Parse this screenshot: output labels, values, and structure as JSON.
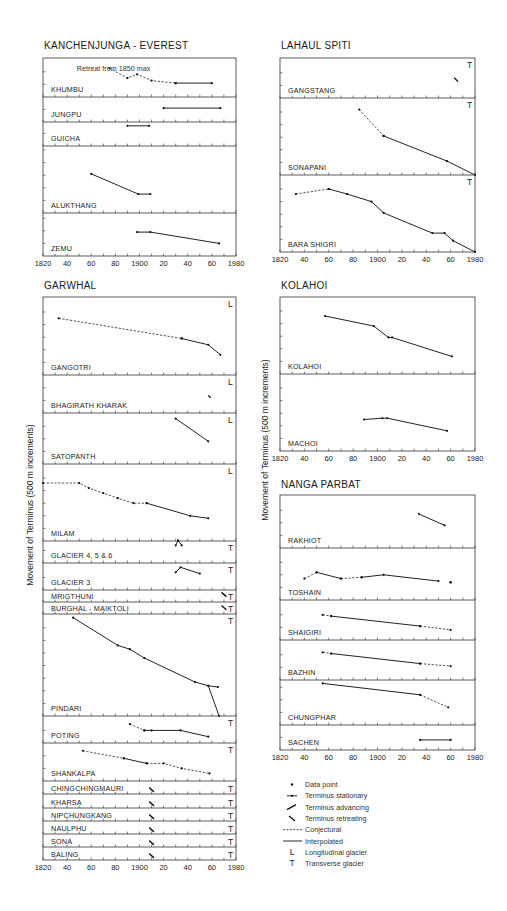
{
  "figure": {
    "y_axis_label": "Movement of Terminus (500 m increments)",
    "x_tick_labels": [
      "1820",
      "40",
      "60",
      "80",
      "1900",
      "20",
      "40",
      "60",
      "1980"
    ]
  },
  "legend": [
    {
      "symbol": "data-point",
      "label": "Data point"
    },
    {
      "symbol": "stationary",
      "label": "Terminus stationary"
    },
    {
      "symbol": "advancing",
      "label": "Terminus advancing"
    },
    {
      "symbol": "retreating",
      "label": "Terminus retreating"
    },
    {
      "symbol": "conjectural",
      "label": "Conjectural"
    },
    {
      "symbol": "interpolated",
      "label": "Interpolated"
    },
    {
      "symbol": "L",
      "label": "Longitudinal glacier"
    },
    {
      "symbol": "T",
      "label": "Transverse glacier"
    }
  ],
  "chart_data": [
    {
      "type": "line",
      "region": "KANCHENJUNGA - EVEREST",
      "xlim": [
        1820,
        1980
      ],
      "xlabel": "Year",
      "ylabel": "Movement of Terminus (500 m increments)",
      "annotation": "Retreat from 1850 max",
      "glaciers": [
        {
          "name": "KHUMBU",
          "type": "",
          "conjectural": [
            [
              1875,
              2.3
            ],
            [
              1890,
              1.5
            ],
            [
              1898,
              1.8
            ],
            [
              1910,
              1.3
            ],
            [
              1930,
              1.1
            ]
          ],
          "interpolated": [
            [
              1930,
              1.1
            ],
            [
              1960,
              1.1
            ]
          ]
        },
        {
          "name": "JUNGPU",
          "type": "",
          "interpolated": [
            [
              1920,
              1.1
            ],
            [
              1967,
              1.1
            ]
          ]
        },
        {
          "name": "GUICHA",
          "type": "",
          "interpolated": [
            [
              1890,
              1.6
            ],
            [
              1908,
              1.6
            ]
          ]
        },
        {
          "name": "ALUKTHANG",
          "type": "",
          "interpolated": [
            [
              1860,
              3.1
            ],
            [
              1899,
              1.5
            ],
            [
              1909,
              1.5
            ]
          ]
        },
        {
          "name": "ZEMU",
          "type": "",
          "interpolated": [
            [
              1898,
              1.9
            ],
            [
              1909,
              1.9
            ],
            [
              1966,
              1.0
            ]
          ]
        }
      ]
    },
    {
      "type": "line",
      "region": "LAHAUL SPITI",
      "xlim": [
        1820,
        1980
      ],
      "glaciers": [
        {
          "name": "GANGSTANG",
          "type": "T",
          "retreating": [
            [
              1963,
              1.6
            ],
            [
              1966,
              1.3
            ]
          ]
        },
        {
          "name": "SONAPANI",
          "type": "T",
          "conjectural": [
            [
              1885,
              5.2
            ],
            [
              1905,
              3.1
            ]
          ],
          "interpolated": [
            [
              1905,
              3.1
            ],
            [
              1957,
              1.1
            ],
            [
              1980,
              0.0
            ]
          ]
        },
        {
          "name": "BARA SHIGRI",
          "type": "T",
          "conjectural": [
            [
              1833,
              4.6
            ],
            [
              1860,
              5.0
            ]
          ],
          "interpolated": [
            [
              1860,
              5.0
            ],
            [
              1875,
              4.6
            ],
            [
              1895,
              4.0
            ],
            [
              1905,
              3.1
            ],
            [
              1945,
              1.5
            ],
            [
              1955,
              1.5
            ],
            [
              1962,
              0.9
            ],
            [
              1980,
              0.0
            ]
          ]
        }
      ]
    },
    {
      "type": "line",
      "region": "GARWHAL",
      "xlim": [
        1820,
        1980
      ],
      "glaciers": [
        {
          "name": "GANGOTRI",
          "type": "L",
          "conjectural": [
            [
              1833,
              4.5
            ],
            [
              1935,
              2.9
            ]
          ],
          "interpolated": [
            [
              1935,
              2.9
            ],
            [
              1957,
              2.4
            ],
            [
              1967,
              1.6
            ]
          ]
        },
        {
          "name": "BHAGIRATH KHARAK",
          "type": "L",
          "retreating": [
            [
              1957,
              1.4
            ],
            [
              1959,
              1.2
            ]
          ]
        },
        {
          "name": "SATOPANTH",
          "type": "L",
          "interpolated": [
            [
              1930,
              3.6
            ],
            [
              1957,
              1.8
            ]
          ]
        },
        {
          "name": "MILAM",
          "type": "L",
          "conjectural": [
            [
              1820,
              4.6
            ],
            [
              1850,
              4.6
            ],
            [
              1858,
              4.2
            ],
            [
              1870,
              3.8
            ],
            [
              1882,
              3.4
            ],
            [
              1895,
              3.0
            ],
            [
              1906,
              3.0
            ]
          ],
          "interpolated": [
            [
              1906,
              3.0
            ],
            [
              1942,
              2.0
            ],
            [
              1957,
              1.8
            ]
          ]
        },
        {
          "name": "GLACIER 4, 5 & 6",
          "type": "T",
          "advancing": [
            [
              1930,
              1.4
            ],
            [
              1932,
              1.8
            ],
            [
              1935,
              1.4
            ]
          ]
        },
        {
          "name": "GLACIER 3",
          "type": "T",
          "interpolated": [
            [
              1930,
              1.4
            ],
            [
              1934,
              1.8
            ],
            [
              1950,
              1.3
            ]
          ]
        },
        {
          "name": "MRIGTHUNI",
          "type": "T",
          "retreating": [
            [
              1968,
              0.9
            ],
            [
              1972,
              0.5
            ]
          ]
        },
        {
          "name": "BURGHAL - MAIKTOLI",
          "type": "T",
          "retreating": [
            [
              1968,
              0.8
            ],
            [
              1972,
              0.4
            ]
          ]
        },
        {
          "name": "PINDARI",
          "type": "T",
          "interpolated": [
            [
              1845,
              7.8
            ],
            [
              1882,
              5.6
            ],
            [
              1892,
              5.3
            ],
            [
              1904,
              4.6
            ],
            [
              1946,
              2.7
            ],
            [
              1957,
              2.4
            ],
            [
              1965,
              2.3
            ]
          ],
          "retreat_drop": [
            [
              1957,
              2.4
            ],
            [
              1966,
              0.0
            ]
          ]
        },
        {
          "name": "POTING",
          "type": "T",
          "conjectural": [
            [
              1892,
              1.5
            ],
            [
              1904,
              1.0
            ]
          ],
          "interpolated": [
            [
              1904,
              1.0
            ],
            [
              1910,
              1.0
            ],
            [
              1934,
              1.0
            ],
            [
              1957,
              0.5
            ]
          ]
        },
        {
          "name": "SHANKALPA",
          "type": "T",
          "conjectural": [
            [
              1853,
              2.4
            ],
            [
              1887,
              1.8
            ]
          ],
          "interpolated": [
            [
              1887,
              1.8
            ],
            [
              1906,
              1.4
            ]
          ],
          "conjectural_2": [
            [
              1906,
              1.4
            ],
            [
              1920,
              1.4
            ],
            [
              1935,
              1.0
            ],
            [
              1958,
              0.6
            ]
          ]
        },
        {
          "name": "CHINGCHINGMAURI",
          "type": "T",
          "retreating": [
            [
              1908,
              0.6
            ],
            [
              1912,
              0.2
            ]
          ]
        },
        {
          "name": "KHARSA",
          "type": "T",
          "retreating": [
            [
              1908,
              0.6
            ],
            [
              1912,
              0.2
            ]
          ]
        },
        {
          "name": "NIPCHUNGKANG",
          "type": "T",
          "retreating": [
            [
              1908,
              0.6
            ],
            [
              1912,
              0.2
            ]
          ]
        },
        {
          "name": "NAULPHU",
          "type": "T",
          "retreating": [
            [
              1908,
              0.6
            ],
            [
              1912,
              0.2
            ]
          ]
        },
        {
          "name": "SONA",
          "type": "T",
          "retreating": [
            [
              1908,
              0.6
            ],
            [
              1912,
              0.2
            ]
          ]
        },
        {
          "name": "BALING",
          "type": "T",
          "retreating": [
            [
              1908,
              0.6
            ],
            [
              1912,
              0.2
            ]
          ]
        }
      ]
    },
    {
      "type": "line",
      "region": "KOLAHOI",
      "xlim": [
        1820,
        1980
      ],
      "glaciers": [
        {
          "name": "KOLAHOI",
          "type": "",
          "interpolated": [
            [
              1857,
              4.6
            ],
            [
              1897,
              3.8
            ],
            [
              1909,
              2.9
            ],
            [
              1912,
              2.9
            ],
            [
              1961,
              1.4
            ]
          ]
        },
        {
          "name": "MACHOI",
          "type": "",
          "interpolated": [
            [
              1889,
              2.5
            ],
            [
              1904,
              2.6
            ],
            [
              1908,
              2.6
            ],
            [
              1957,
              1.6
            ]
          ]
        }
      ]
    },
    {
      "type": "line",
      "region": "NANGA PARBAT",
      "xlim": [
        1820,
        1980
      ],
      "glaciers": [
        {
          "name": "RAKHIOT",
          "type": "",
          "interpolated": [
            [
              1934,
              2.7
            ],
            [
              1955,
              1.8
            ]
          ]
        },
        {
          "name": "TOSHAIN",
          "type": "",
          "conjectural": [
            [
              1840,
              1.7
            ],
            [
              1850,
              2.2
            ]
          ],
          "interpolated": [
            [
              1850,
              2.2
            ],
            [
              1870,
              1.7
            ]
          ],
          "conjectural_2": [
            [
              1870,
              1.7
            ],
            [
              1887,
              1.8
            ]
          ],
          "interpolated_2": [
            [
              1887,
              1.8
            ],
            [
              1905,
              2.0
            ],
            [
              1950,
              1.5
            ]
          ],
          "data_point": [
            [
              1960,
              1.4
            ]
          ]
        },
        {
          "name": "SHAIGIRI",
          "type": "",
          "conjectural": [
            [
              1855,
              2.0
            ],
            [
              1862,
              1.9
            ]
          ],
          "interpolated": [
            [
              1862,
              1.9
            ],
            [
              1935,
              1.1
            ]
          ],
          "conjectural_2": [
            [
              1935,
              1.1
            ],
            [
              1960,
              0.8
            ]
          ]
        },
        {
          "name": "BAZHIN",
          "type": "",
          "conjectural": [
            [
              1855,
              2.2
            ],
            [
              1862,
              2.1
            ]
          ],
          "interpolated": [
            [
              1862,
              2.1
            ],
            [
              1935,
              1.3
            ]
          ],
          "conjectural_2": [
            [
              1935,
              1.3
            ],
            [
              1960,
              1.1
            ]
          ]
        },
        {
          "name": "CHUNGPHAR",
          "type": "",
          "interpolated": [
            [
              1855,
              3.3
            ],
            [
              1935,
              2.4
            ]
          ],
          "conjectural": [
            [
              1935,
              2.4
            ],
            [
              1958,
              1.4
            ]
          ]
        },
        {
          "name": "SACHEN",
          "type": "",
          "interpolated": [
            [
              1935,
              0.8
            ],
            [
              1960,
              0.8
            ]
          ]
        }
      ]
    }
  ]
}
